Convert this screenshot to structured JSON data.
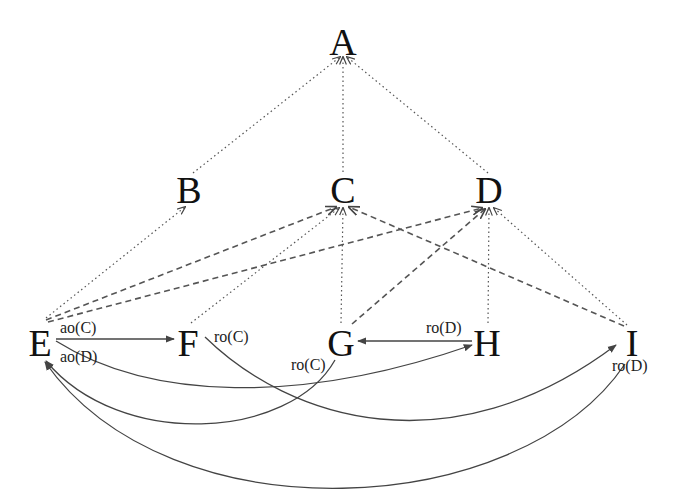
{
  "diagram": {
    "type": "directed-graph",
    "nodes": [
      {
        "id": "A",
        "label": "A",
        "x": 343,
        "y": 42
      },
      {
        "id": "B",
        "label": "B",
        "x": 188,
        "y": 190
      },
      {
        "id": "C",
        "label": "C",
        "x": 343,
        "y": 190
      },
      {
        "id": "D",
        "label": "D",
        "x": 489,
        "y": 190
      },
      {
        "id": "E",
        "label": "E",
        "x": 40,
        "y": 343
      },
      {
        "id": "F",
        "label": "F",
        "x": 186,
        "y": 343
      },
      {
        "id": "G",
        "label": "G",
        "x": 341,
        "y": 343
      },
      {
        "id": "H",
        "label": "H",
        "x": 487,
        "y": 343
      },
      {
        "id": "I",
        "label": "I",
        "x": 632,
        "y": 343
      }
    ],
    "edges": {
      "dotted": [
        {
          "from": "B",
          "to": "A"
        },
        {
          "from": "C",
          "to": "A"
        },
        {
          "from": "D",
          "to": "A"
        },
        {
          "from": "E",
          "to": "B"
        },
        {
          "from": "F",
          "to": "C"
        },
        {
          "from": "G",
          "to": "C"
        },
        {
          "from": "H",
          "to": "D"
        },
        {
          "from": "I",
          "to": "D"
        }
      ],
      "dashed": [
        {
          "from": "E",
          "to": "C"
        },
        {
          "from": "E",
          "to": "D"
        },
        {
          "from": "G",
          "to": "D"
        },
        {
          "from": "I",
          "to": "C"
        }
      ],
      "solid": [
        {
          "from": "E",
          "to": "F",
          "label": "ao(C)",
          "shape": "straight"
        },
        {
          "from": "H",
          "to": "G",
          "label": "ro(D)",
          "shape": "straight"
        },
        {
          "from": "E",
          "to": "H",
          "label": "ao(D)",
          "shape": "curve"
        },
        {
          "from": "F",
          "to": "I",
          "label": "ro(C)",
          "shape": "curve"
        },
        {
          "from": "G",
          "to": "E",
          "label": "ro(C)",
          "shape": "curve"
        },
        {
          "from": "I",
          "to": "E",
          "label": "ro(D)",
          "shape": "curve"
        }
      ]
    },
    "edge_labels": {
      "e_f": "ao(C)",
      "e_h": "ao(D)",
      "f_i": "ro(C)",
      "h_g": "ro(D)",
      "g_e": "ro(C)",
      "i_e": "ro(D)"
    },
    "node_labels": {
      "A": "A",
      "B": "B",
      "C": "C",
      "D": "D",
      "E": "E",
      "F": "F",
      "G": "G",
      "H": "H",
      "I": "I"
    },
    "colors": {
      "background": "#ffffff",
      "text": "#111111",
      "edge": "#555555"
    }
  }
}
